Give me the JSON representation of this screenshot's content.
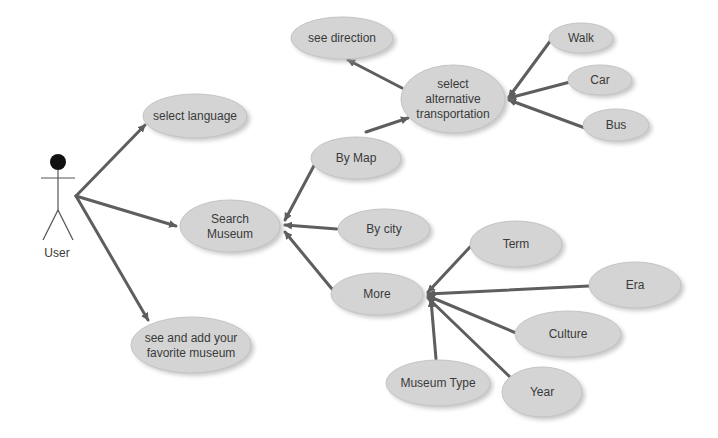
{
  "diagram": {
    "type": "use-case",
    "colors": {
      "ellipse_fill": "#d4d4d4",
      "ellipse_shadow": "#9a9a9a",
      "edge": "#5e5e5e",
      "text": "#3a3a3a",
      "actor_head": "#111111"
    },
    "actor": {
      "label": "User",
      "x": 55,
      "y": 162
    },
    "nodes": [
      {
        "id": "select_language",
        "lines": [
          "select language"
        ],
        "cx": 195,
        "cy": 116,
        "rx": 52,
        "ry": 22
      },
      {
        "id": "search_museum",
        "lines": [
          "Search",
          "Museum"
        ],
        "cx": 230,
        "cy": 226,
        "rx": 50,
        "ry": 26
      },
      {
        "id": "favorite_museum",
        "lines": [
          "see and add your",
          "favorite museum"
        ],
        "cx": 191,
        "cy": 345,
        "rx": 60,
        "ry": 28
      },
      {
        "id": "by_map",
        "lines": [
          "By Map"
        ],
        "cx": 356,
        "cy": 158,
        "rx": 45,
        "ry": 21
      },
      {
        "id": "by_city",
        "lines": [
          "By city"
        ],
        "cx": 384,
        "cy": 229,
        "rx": 46,
        "ry": 20
      },
      {
        "id": "more",
        "lines": [
          "More"
        ],
        "cx": 377,
        "cy": 294,
        "rx": 46,
        "ry": 21
      },
      {
        "id": "select_transport",
        "lines": [
          "select",
          "alternative",
          "transportation"
        ],
        "cx": 453,
        "cy": 99,
        "rx": 52,
        "ry": 34
      },
      {
        "id": "see_direction",
        "lines": [
          "see direction"
        ],
        "cx": 342,
        "cy": 38,
        "rx": 51,
        "ry": 21
      },
      {
        "id": "walk",
        "lines": [
          "Walk"
        ],
        "cx": 581,
        "cy": 38,
        "rx": 32,
        "ry": 15
      },
      {
        "id": "car",
        "lines": [
          "Car"
        ],
        "cx": 600,
        "cy": 80,
        "rx": 32,
        "ry": 15
      },
      {
        "id": "bus",
        "lines": [
          "Bus"
        ],
        "cx": 616,
        "cy": 125,
        "rx": 33,
        "ry": 16
      },
      {
        "id": "term",
        "lines": [
          "Term"
        ],
        "cx": 516,
        "cy": 244,
        "rx": 46,
        "ry": 23
      },
      {
        "id": "era",
        "lines": [
          "Era"
        ],
        "cx": 635,
        "cy": 285,
        "rx": 46,
        "ry": 23
      },
      {
        "id": "culture",
        "lines": [
          "Culture"
        ],
        "cx": 568,
        "cy": 334,
        "rx": 53,
        "ry": 23
      },
      {
        "id": "museum_type",
        "lines": [
          "Museum Type"
        ],
        "cx": 438,
        "cy": 383,
        "rx": 52,
        "ry": 23
      },
      {
        "id": "year",
        "lines": [
          "Year"
        ],
        "cx": 542,
        "cy": 392,
        "rx": 40,
        "ry": 25
      }
    ],
    "edges": [
      {
        "from": [
          76,
          196
        ],
        "to": [
          145,
          125
        ],
        "arrow": true
      },
      {
        "from": [
          76,
          196
        ],
        "to": [
          176,
          226
        ],
        "arrow": true
      },
      {
        "from": [
          76,
          196
        ],
        "to": [
          148,
          320
        ],
        "arrow": true
      },
      {
        "from": [
          317,
          160
        ],
        "to": [
          285,
          220
        ],
        "arrow": true
      },
      {
        "from": [
          337,
          229
        ],
        "to": [
          285,
          225
        ],
        "arrow": true
      },
      {
        "from": [
          332,
          289
        ],
        "to": [
          285,
          232
        ],
        "arrow": true
      },
      {
        "from": [
          366,
          132
        ],
        "to": [
          408,
          118
        ],
        "arrow": true
      },
      {
        "from": [
          402,
          88
        ],
        "to": [
          348,
          60
        ],
        "arrow": true
      },
      {
        "from": [
          551,
          40
        ],
        "to": [
          509,
          97
        ],
        "arrow": true
      },
      {
        "from": [
          570,
          82
        ],
        "to": [
          509,
          98
        ],
        "arrow": true
      },
      {
        "from": [
          585,
          128
        ],
        "to": [
          509,
          100
        ],
        "arrow": true
      },
      {
        "from": [
          470,
          247
        ],
        "to": [
          428,
          292
        ],
        "arrow": true
      },
      {
        "from": [
          589,
          286
        ],
        "to": [
          428,
          294
        ],
        "arrow": true
      },
      {
        "from": [
          516,
          333
        ],
        "to": [
          428,
          296
        ],
        "arrow": true
      },
      {
        "from": [
          510,
          377
        ],
        "to": [
          428,
          298
        ],
        "arrow": true
      },
      {
        "from": [
          436,
          359
        ],
        "to": [
          431,
          300
        ],
        "arrow": true
      }
    ]
  }
}
